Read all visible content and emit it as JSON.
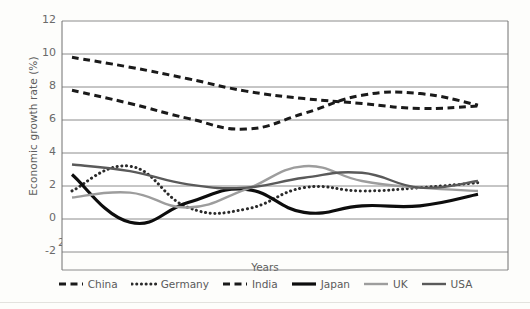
{
  "chart_data": {
    "type": "line",
    "title": "",
    "xlabel": "Years",
    "ylabel": "Economic growth rate (%)",
    "categories": [
      "2010",
      "2011",
      "2012",
      "2013",
      "2014",
      "2015",
      "2016",
      "2017"
    ],
    "x": [
      2010,
      2011,
      2012,
      2013,
      2014,
      2015,
      2016,
      2017
    ],
    "ylim": [
      -2,
      12
    ],
    "yticks": [
      -2,
      0,
      2,
      4,
      6,
      8,
      10,
      12
    ],
    "grid": "horizontal",
    "legend_position": "bottom",
    "series": [
      {
        "name": "China",
        "style": "dashed",
        "color": "#1a1a1a",
        "values": [
          9.8,
          9.2,
          8.5,
          7.75,
          7.3,
          7.0,
          6.7,
          6.85
        ]
      },
      {
        "name": "Germany",
        "style": "dotted",
        "color": "#2a2a2a",
        "values": [
          1.7,
          3.2,
          0.7,
          0.6,
          1.9,
          1.7,
          1.9,
          2.2
        ]
      },
      {
        "name": "India",
        "style": "dashed",
        "color": "#1a1a1a",
        "values": [
          7.8,
          7.0,
          6.1,
          5.45,
          6.4,
          7.5,
          7.6,
          6.9
        ]
      },
      {
        "name": "Japan",
        "style": "solid",
        "color": "#0d0d0d",
        "values": [
          2.7,
          -0.2,
          1.0,
          1.8,
          0.4,
          0.8,
          0.8,
          1.5
        ]
      },
      {
        "name": "UK",
        "style": "solid",
        "color": "#9d9d9d",
        "values": [
          1.3,
          1.6,
          0.7,
          1.8,
          3.2,
          2.3,
          1.9,
          1.7
        ]
      },
      {
        "name": "USA",
        "style": "solid",
        "color": "#5a5a5a",
        "values": [
          3.3,
          2.9,
          2.1,
          1.9,
          2.5,
          2.8,
          1.9,
          2.3
        ]
      }
    ]
  },
  "legend": {
    "items": [
      {
        "label": "China",
        "icon": "dashed-line-swatch"
      },
      {
        "label": "Germany",
        "icon": "dotted-line-swatch"
      },
      {
        "label": "India",
        "icon": "dashed-line-swatch"
      },
      {
        "label": "Japan",
        "icon": "solid-line-swatch"
      },
      {
        "label": "UK",
        "icon": "solid-line-swatch"
      },
      {
        "label": "USA",
        "icon": "solid-line-swatch"
      }
    ]
  },
  "axes": {
    "y_tick_labels": [
      "12",
      "10",
      "8",
      "6",
      "4",
      "2",
      "0",
      "-2"
    ],
    "x_tick_labels": [
      "2010",
      "2011",
      "2012",
      "2013",
      "2014",
      "2015",
      "2016",
      "2017"
    ],
    "x_title": "Years",
    "y_title": "Economic growth rate (%)"
  },
  "colors": {
    "background": "#fdfdfb",
    "plot_background": "#ffffff",
    "gridline": "#808080",
    "frame": "#707070",
    "tick_text": "#6a6a6a"
  }
}
